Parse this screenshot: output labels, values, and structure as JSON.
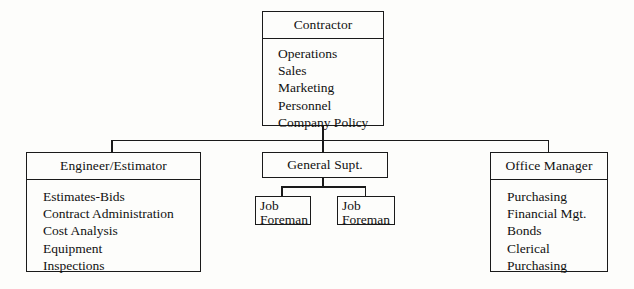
{
  "diagram": {
    "line_color": "#1a1a1a",
    "background_color": "#fdfdfb",
    "text_color": "#111111"
  },
  "nodes": {
    "contractor": {
      "header": "Contractor",
      "items": [
        "Operations",
        "Sales",
        "Marketing",
        "Personnel",
        "Company Policy"
      ]
    },
    "engineer": {
      "header": "Engineer/Estimator",
      "items": [
        "Estimates-Bids",
        "Contract Administration",
        "Cost Analysis",
        "Equipment",
        "Inspections"
      ]
    },
    "general_supt": {
      "header": "General Supt.",
      "items": []
    },
    "office_manager": {
      "header": "Office Manager",
      "items": [
        "Purchasing",
        "Financial Mgt.",
        "Bonds",
        "Clerical",
        "Purchasing"
      ]
    },
    "foreman_1": {
      "line1": "Job",
      "line2": "Foreman"
    },
    "foreman_2": {
      "line1": "Job",
      "line2": "Foreman"
    }
  }
}
